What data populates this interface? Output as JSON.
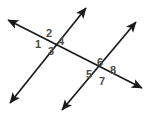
{
  "figure": {
    "canvas": {
      "width": 148,
      "height": 116
    },
    "background_color": "#ffffff",
    "line_color": "#1a1a1a",
    "marker_color": "#8c8c8c",
    "label_color": "#4a4a4a"
  },
  "lines": [
    {
      "name": "transversal",
      "description": "line from upper-left to lower-right crossing both parallel lines",
      "x1": 8,
      "y1": 20,
      "x2": 142,
      "y2": 88,
      "arrow_start": true,
      "arrow_end": true,
      "parallel_marker": false
    },
    {
      "name": "parallel-line-a",
      "description": "first parallel line, lower-left to upper-right",
      "x1": 10,
      "y1": 103,
      "x2": 86,
      "y2": 8,
      "arrow_start": true,
      "arrow_end": true,
      "parallel_marker": true,
      "marker_t": 0.74
    },
    {
      "name": "parallel-line-b",
      "description": "second parallel line, lower-left to upper-right",
      "x1": 62,
      "y1": 110,
      "x2": 136,
      "y2": 22,
      "arrow_start": true,
      "arrow_end": true,
      "parallel_marker": true,
      "marker_t": 0.7
    }
  ],
  "intersections": [
    {
      "name": "intersection-upper-left",
      "x": 48,
      "y": 43
    },
    {
      "name": "intersection-lower-right",
      "x": 99,
      "y": 72
    }
  ],
  "angle_labels": [
    {
      "id": "1",
      "text": "1",
      "x": 38,
      "y": 45
    },
    {
      "id": "2",
      "text": "2",
      "x": 49,
      "y": 34
    },
    {
      "id": "3",
      "text": "3",
      "x": 51,
      "y": 52
    },
    {
      "id": "4",
      "text": "4",
      "x": 61,
      "y": 42
    },
    {
      "id": "5",
      "text": "5",
      "x": 89,
      "y": 75
    },
    {
      "id": "6",
      "text": "6",
      "x": 100,
      "y": 63
    },
    {
      "id": "7",
      "text": "7",
      "x": 102,
      "y": 82
    },
    {
      "id": "8",
      "text": "8",
      "x": 113,
      "y": 71
    }
  ]
}
